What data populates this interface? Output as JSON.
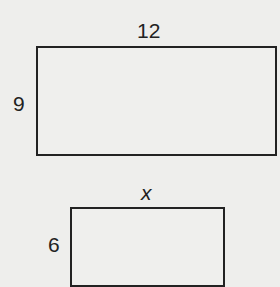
{
  "figure": {
    "shapes": [
      {
        "name": "large-rectangle",
        "width_label": "12",
        "height_label": "9"
      },
      {
        "name": "small-rectangle",
        "width_label": "x",
        "height_label": "6"
      }
    ]
  },
  "colors": {
    "background": "#eeeeec",
    "stroke": "#222222"
  }
}
